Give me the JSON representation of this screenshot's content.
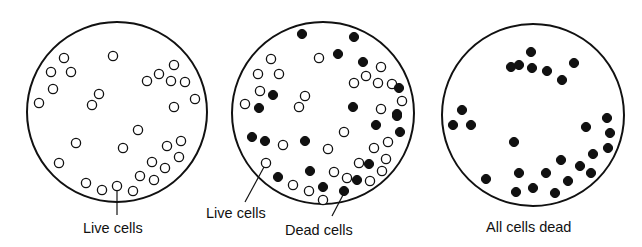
{
  "colors": {
    "ink": "#111111",
    "background": "#ffffff"
  },
  "cell_radius": 4.6,
  "dishes": [
    {
      "name": "dish-all-live",
      "cx": 117,
      "cy": 112,
      "r": 90,
      "live_cells": [
        [
          64,
          58
        ],
        [
          51,
          72
        ],
        [
          71,
          72
        ],
        [
          53,
          89
        ],
        [
          39,
          103
        ],
        [
          113,
          56
        ],
        [
          99,
          94
        ],
        [
          92,
          105
        ],
        [
          174,
          65
        ],
        [
          159,
          74
        ],
        [
          147,
          81
        ],
        [
          171,
          81
        ],
        [
          185,
          82
        ],
        [
          195,
          99
        ],
        [
          174,
          107
        ],
        [
          138,
          130
        ],
        [
          181,
          141
        ],
        [
          167,
          146
        ],
        [
          123,
          148
        ],
        [
          76,
          143
        ],
        [
          59,
          163
        ],
        [
          179,
          157
        ],
        [
          152,
          162
        ],
        [
          165,
          168
        ],
        [
          140,
          176
        ],
        [
          154,
          180
        ],
        [
          86,
          183
        ],
        [
          102,
          190
        ],
        [
          117,
          186
        ],
        [
          133,
          191
        ]
      ],
      "dead_cells": []
    },
    {
      "name": "dish-mixed",
      "cx": 323,
      "cy": 113,
      "r": 91,
      "live_cells": [
        [
          271,
          59
        ],
        [
          319,
          58
        ],
        [
          258,
          74
        ],
        [
          279,
          74
        ],
        [
          260,
          91
        ],
        [
          305,
          96
        ],
        [
          245,
          104
        ],
        [
          299,
          107
        ],
        [
          381,
          67
        ],
        [
          366,
          76
        ],
        [
          354,
          83
        ],
        [
          378,
          83
        ],
        [
          392,
          84
        ],
        [
          402,
          101
        ],
        [
          381,
          109
        ],
        [
          283,
          145
        ],
        [
          328,
          149
        ],
        [
          266,
          163
        ],
        [
          293,
          185
        ],
        [
          309,
          191
        ],
        [
          323,
          200
        ],
        [
          344,
          132
        ],
        [
          388,
          142
        ],
        [
          374,
          148
        ],
        [
          386,
          159
        ],
        [
          359,
          163
        ],
        [
          382,
          171
        ],
        [
          334,
          172
        ],
        [
          347,
          178
        ],
        [
          370,
          181
        ]
      ],
      "dead_cells": [
        [
          302,
          34
        ],
        [
          273,
          95
        ],
        [
          259,
          108
        ],
        [
          354,
          37
        ],
        [
          338,
          54
        ],
        [
          363,
          62
        ],
        [
          399,
          88
        ],
        [
          353,
          107
        ],
        [
          397,
          114
        ],
        [
          252,
          137
        ],
        [
          265,
          141
        ],
        [
          305,
          141
        ],
        [
          278,
          177
        ],
        [
          310,
          171
        ],
        [
          323,
          187
        ],
        [
          397,
          116
        ],
        [
          376,
          125
        ],
        [
          400,
          132
        ],
        [
          369,
          164
        ],
        [
          357,
          180
        ],
        [
          344,
          191
        ]
      ]
    },
    {
      "name": "dish-all-dead",
      "cx": 533,
      "cy": 115,
      "r": 91,
      "live_cells": [],
      "dead_cells": [
        [
          531,
          52
        ],
        [
          511,
          67
        ],
        [
          519,
          65
        ],
        [
          532,
          68
        ],
        [
          547,
          71
        ],
        [
          574,
          63
        ],
        [
          562,
          80
        ],
        [
          462,
          110
        ],
        [
          453,
          125
        ],
        [
          471,
          125
        ],
        [
          586,
          127
        ],
        [
          607,
          118
        ],
        [
          610,
          133
        ],
        [
          608,
          148
        ],
        [
          593,
          154
        ],
        [
          514,
          142
        ],
        [
          561,
          160
        ],
        [
          580,
          166
        ],
        [
          591,
          173
        ],
        [
          486,
          179
        ],
        [
          519,
          173
        ],
        [
          546,
          173
        ],
        [
          568,
          181
        ],
        [
          516,
          192
        ],
        [
          533,
          188
        ],
        [
          555,
          193
        ]
      ]
    }
  ],
  "leaders": [
    {
      "name": "leader-live-cells-left",
      "x1": 117,
      "y1": 191,
      "x2": 117,
      "y2": 215
    },
    {
      "name": "leader-live-cells-middle",
      "x1": 264,
      "y1": 167,
      "x2": 245,
      "y2": 202
    },
    {
      "name": "leader-dead-cells-middle",
      "x1": 343,
      "y1": 195,
      "x2": 332,
      "y2": 216
    }
  ],
  "labels": {
    "left_live": {
      "text": "Live cells",
      "x": 83,
      "y": 221
    },
    "middle_live": {
      "text": "Live cells",
      "x": 206,
      "y": 206
    },
    "middle_dead": {
      "text": "Dead cells",
      "x": 285,
      "y": 223
    },
    "right_dead": {
      "text": "All cells dead",
      "x": 486,
      "y": 220
    }
  }
}
